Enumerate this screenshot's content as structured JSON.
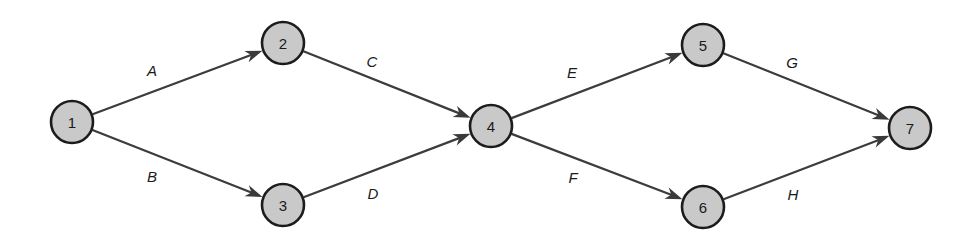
{
  "diagram": {
    "type": "directed-graph",
    "canvas": {
      "width": 973,
      "height": 246,
      "background": "#ffffff"
    },
    "style": {
      "node_fill": "#c9c9c9",
      "node_stroke": "#1c1c1c",
      "edge_color": "#3c3c3c",
      "arrow_color": "#3a3a3a",
      "label_color": "#1a1a1a"
    },
    "nodes": [
      {
        "id": "1",
        "label": "1",
        "x": 72,
        "y": 122,
        "r": 21
      },
      {
        "id": "2",
        "label": "2",
        "x": 283,
        "y": 43,
        "r": 21
      },
      {
        "id": "3",
        "label": "3",
        "x": 283,
        "y": 205,
        "r": 21
      },
      {
        "id": "4",
        "label": "4",
        "x": 491,
        "y": 126,
        "r": 21
      },
      {
        "id": "5",
        "label": "5",
        "x": 703,
        "y": 45,
        "r": 21
      },
      {
        "id": "6",
        "label": "6",
        "x": 703,
        "y": 207,
        "r": 21
      },
      {
        "id": "7",
        "label": "7",
        "x": 910,
        "y": 128,
        "r": 21
      }
    ],
    "edges": [
      {
        "id": "A",
        "label": "A",
        "from": "1",
        "to": "2",
        "label_x": 152,
        "label_y": 70
      },
      {
        "id": "B",
        "label": "B",
        "from": "1",
        "to": "3",
        "label_x": 152,
        "label_y": 176
      },
      {
        "id": "C",
        "label": "C",
        "from": "2",
        "to": "4",
        "label_x": 372,
        "label_y": 61
      },
      {
        "id": "D",
        "label": "D",
        "from": "3",
        "to": "4",
        "label_x": 373,
        "label_y": 193
      },
      {
        "id": "E",
        "label": "E",
        "from": "4",
        "to": "5",
        "label_x": 572,
        "label_y": 72
      },
      {
        "id": "F",
        "label": "F",
        "from": "4",
        "to": "6",
        "label_x": 573,
        "label_y": 177
      },
      {
        "id": "G",
        "label": "G",
        "from": "5",
        "to": "7",
        "label_x": 792,
        "label_y": 62
      },
      {
        "id": "H",
        "label": "H",
        "from": "6",
        "to": "7",
        "label_x": 793,
        "label_y": 194
      }
    ]
  }
}
